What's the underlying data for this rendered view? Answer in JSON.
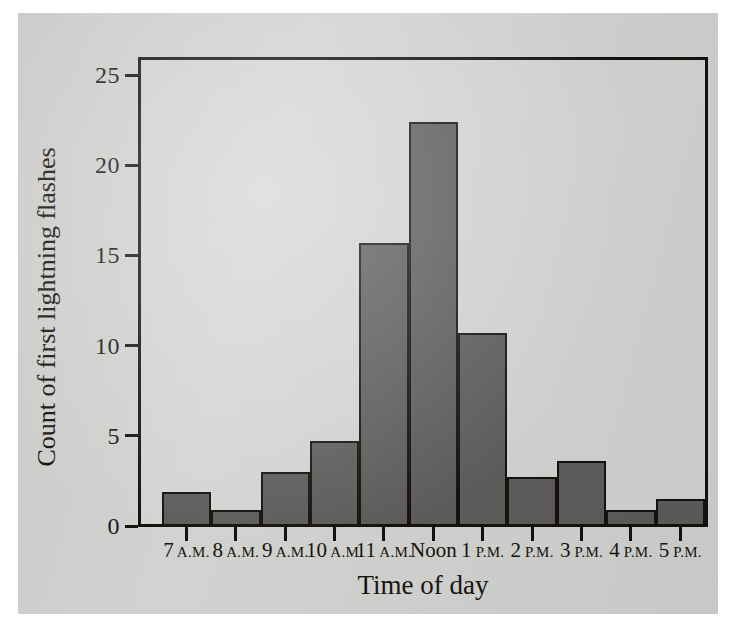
{
  "figure": {
    "background_color": "#d2d2d0",
    "bar_color": "#5e5d5b",
    "bar_outline_color": "#15120f",
    "axis_color": "#14110f"
  },
  "chart_data": {
    "type": "bar",
    "title": "",
    "xlabel": "Time of day",
    "ylabel": "Count of first lightning flashes",
    "categories": [
      "7 A.M.",
      "8 A.M.",
      "9 A.M.",
      "10 A.M.",
      "11 A.M.",
      "Noon",
      "1 P.M.",
      "2 P.M.",
      "3 P.M.",
      "4 P.M.",
      "5 P.M."
    ],
    "category_parts": [
      {
        "num": "7",
        "suffix": "A.M."
      },
      {
        "num": "8",
        "suffix": "A.M."
      },
      {
        "num": "9",
        "suffix": "A.M."
      },
      {
        "num": "10",
        "suffix": "A.M."
      },
      {
        "num": "11",
        "suffix": "A.M."
      },
      {
        "num": "Noon",
        "suffix": ""
      },
      {
        "num": "1",
        "suffix": "P.M."
      },
      {
        "num": "2",
        "suffix": "P.M."
      },
      {
        "num": "3",
        "suffix": "P.M."
      },
      {
        "num": "4",
        "suffix": "P.M."
      },
      {
        "num": "5",
        "suffix": "P.M."
      }
    ],
    "values": [
      1.9,
      0.9,
      3.0,
      4.7,
      15.7,
      22.4,
      10.7,
      2.7,
      3.6,
      0.9,
      1.5
    ],
    "ylim": [
      0,
      26
    ],
    "yticks": [
      0,
      5,
      10,
      15,
      20,
      25
    ],
    "ytick_labels": [
      "0",
      "5",
      "10",
      "15",
      "20",
      "25"
    ],
    "grid": false,
    "legend": null
  }
}
